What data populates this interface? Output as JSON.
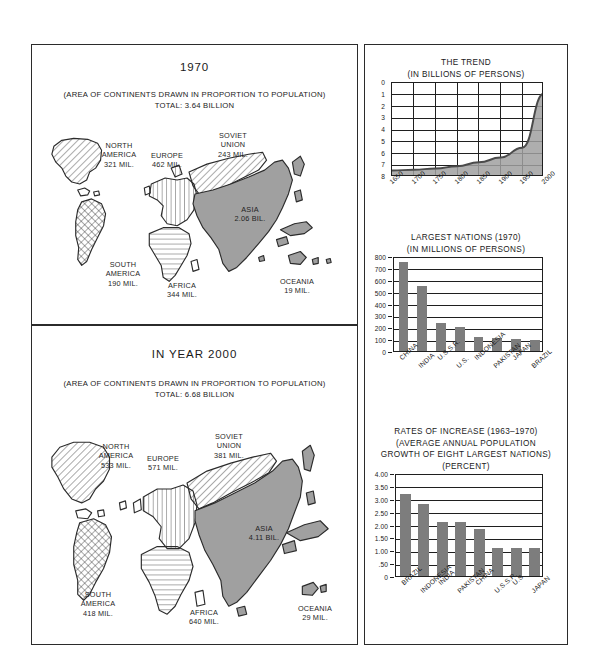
{
  "maps": [
    {
      "id": "map-1970",
      "year_title": "1970",
      "subtitle_line1": "(AREA OF CONTINENTS DRAWN IN PROPORTION TO POPULATION)",
      "subtitle_line2": "TOTAL: 3.64 BILLION",
      "regions": [
        {
          "name": "north-america",
          "label": "NORTH\nAMERICA\n321 MIL.",
          "value": 321,
          "unit": "MIL.",
          "fill": "diagonal-hatch"
        },
        {
          "name": "south-america",
          "label": "SOUTH\nAMERICA\n190 MIL.",
          "value": 190,
          "unit": "MIL.",
          "fill": "cross-hatch"
        },
        {
          "name": "europe",
          "label": "EUROPE\n462 MIL.",
          "value": 462,
          "unit": "MIL.",
          "fill": "vertical-hatch"
        },
        {
          "name": "soviet-union",
          "label": "SOVIET\nUNION\n243 MIL.",
          "value": 243,
          "unit": "MIL.",
          "fill": "diagonal-hatch"
        },
        {
          "name": "asia",
          "label": "ASIA\n2.06 BIL.",
          "value": 2.06,
          "unit": "BIL.",
          "fill": "solid-gray"
        },
        {
          "name": "africa",
          "label": "AFRICA\n344 MIL.",
          "value": 344,
          "unit": "MIL.",
          "fill": "horizontal-hatch"
        },
        {
          "name": "oceania",
          "label": "OCEANIA\n19 MIL.",
          "value": 19,
          "unit": "MIL.",
          "fill": "solid-gray"
        }
      ]
    },
    {
      "id": "map-2000",
      "year_title": "IN YEAR 2000",
      "subtitle_line1": "(AREA OF CONTINENTS DRAWN IN PROPORTION TO POPULATION)",
      "subtitle_line2": "TOTAL: 6.68 BILLION",
      "regions": [
        {
          "name": "north-america",
          "label": "NORTH\nAMERICA\n533 MIL.",
          "value": 533,
          "unit": "MIL.",
          "fill": "diagonal-hatch"
        },
        {
          "name": "south-america",
          "label": "SOUTH\nAMERICA\n418 MIL.",
          "value": 418,
          "unit": "MIL.",
          "fill": "cross-hatch"
        },
        {
          "name": "europe",
          "label": "EUROPE\n571 MIL.",
          "value": 571,
          "unit": "MIL.",
          "fill": "vertical-hatch"
        },
        {
          "name": "soviet-union",
          "label": "SOVIET\nUNION\n381 MIL.",
          "value": 381,
          "unit": "MIL.",
          "fill": "diagonal-hatch"
        },
        {
          "name": "asia",
          "label": "ASIA\n4.11 BIL.",
          "value": 4.11,
          "unit": "BIL.",
          "fill": "solid-gray"
        },
        {
          "name": "africa",
          "label": "AFRICA\n640 MIL.",
          "value": 640,
          "unit": "MIL.",
          "fill": "horizontal-hatch"
        },
        {
          "name": "oceania",
          "label": "OCEANIA\n29 MIL.",
          "value": 29,
          "unit": "MIL.",
          "fill": "solid-gray"
        }
      ]
    }
  ],
  "colors": {
    "ink": "#1f1f1f",
    "bar_fill": "#7d7d7d",
    "area_fill": "#a0a0a0",
    "curve": "#4a4a4a",
    "paper": "#ffffff"
  },
  "chart_data": [
    {
      "type": "area",
      "name": "the-trend",
      "title": "THE TREND",
      "subtitle": "(IN BILLIONS OF PERSONS)",
      "xlabel": "",
      "ylabel": "",
      "ylim": [
        0,
        8
      ],
      "xlim": [
        1650,
        2000
      ],
      "grid": true,
      "yticks": [
        "0",
        "1",
        "2",
        "3",
        "4",
        "5",
        "6",
        "7",
        "8"
      ],
      "xticks": [
        "1650",
        "1700",
        "1750",
        "1800",
        "1850",
        "1900",
        "1950",
        "2000"
      ],
      "x": [
        1650,
        1700,
        1750,
        1800,
        1850,
        1900,
        1950,
        2000
      ],
      "values": [
        0.55,
        0.62,
        0.72,
        0.92,
        1.25,
        1.65,
        2.5,
        7.1
      ]
    },
    {
      "type": "bar",
      "name": "largest-nations",
      "title": "LARGEST NATIONS (1970)",
      "subtitle": "(IN MILLIONS OF PERSONS)",
      "xlabel": "",
      "ylabel": "",
      "ylim": [
        0,
        800
      ],
      "grid": true,
      "yticks": [
        "800",
        "700",
        "600",
        "500",
        "400",
        "300",
        "200",
        "100",
        "0"
      ],
      "categories": [
        "CHINA",
        "INDIA",
        "U.S.S.R.",
        "U.S.",
        "INDONESIA",
        "PAKISTAN",
        "JAPAN",
        "BRAZIL"
      ],
      "values": [
        750,
        545,
        240,
        205,
        120,
        112,
        105,
        93
      ]
    },
    {
      "type": "bar",
      "name": "rates-of-increase",
      "title": "RATES OF INCREASE (1963–1970)",
      "subtitle": "(AVERAGE ANNUAL POPULATION",
      "subtitle2": "GROWTH OF EIGHT LARGEST NATIONS)",
      "subtitle3": "(PERCENT)",
      "xlabel": "",
      "ylabel": "",
      "ylim": [
        0,
        4
      ],
      "grid": true,
      "yticks": [
        "4.00",
        "3.50",
        "3.00",
        "2.50",
        "2.00",
        "1.50",
        "1.00",
        ".50",
        "0"
      ],
      "categories": [
        "BRAZIL",
        "INDONESIA",
        "INDIA",
        "PAKISTAN",
        "CHINA",
        "U.S.S.R.",
        "U.S.",
        "JAPAN"
      ],
      "values": [
        3.2,
        2.8,
        2.1,
        2.1,
        1.82,
        1.08,
        1.1,
        1.1
      ]
    }
  ]
}
